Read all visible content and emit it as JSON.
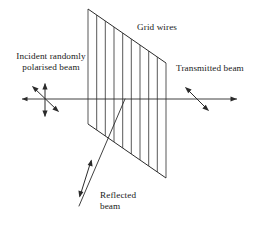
{
  "figure": {
    "type": "optics-schematic",
    "width": 270,
    "height": 227,
    "background_color": "#ffffff",
    "ink_color": "#2b2b2b"
  },
  "labels": {
    "grid_wires": "Grid wires",
    "incident_beam_line1": "Incident randomly",
    "incident_beam_line2": "polarised beam",
    "incident_beam_full": "Incident randomly polarised beam",
    "transmitted_beam": "Transmitted beam",
    "reflected_beam_line1": "Reflected",
    "reflected_beam_line2": "beam",
    "reflected_beam_full": "Reflected beam"
  },
  "grid": {
    "name": "wire-grid-polariser",
    "shape": "parallelogram",
    "corners": {
      "top_left": [
        88,
        9
      ],
      "top_right": [
        166,
        63
      ],
      "bottom_right": [
        166,
        178
      ],
      "bottom_left": [
        88,
        124
      ]
    },
    "wire_count": 10,
    "wire_orientation": "vertical",
    "wire_color": "#3a3a3a"
  },
  "beams": {
    "incident": {
      "name": "incident-beam",
      "from": [
        22,
        99
      ],
      "to": [
        125,
        99
      ],
      "polarisation": "random",
      "polarisation_marks": [
        "vertical-double-arrow",
        "diagonal-double-arrow"
      ]
    },
    "transmitted": {
      "name": "transmitted-beam",
      "from": [
        125,
        99
      ],
      "to": [
        237,
        99
      ],
      "polarisation": "linear-diagonal",
      "polarisation_marks": [
        "diagonal-double-arrow"
      ]
    },
    "reflected": {
      "name": "reflected-beam",
      "from": [
        125,
        99
      ],
      "to": [
        79,
        206
      ],
      "polarisation": "linear-diagonal",
      "polarisation_marks": [
        "diagonal-double-arrow"
      ]
    }
  }
}
